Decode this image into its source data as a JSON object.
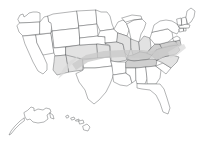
{
  "figure": {
    "type": "map",
    "projection": "albers-usa",
    "background_color": "#ffffff",
    "border_color": "#58595b",
    "highlight_color": "#cfcfcf",
    "partial_color": "#e2e2e2",
    "caption": ""
  },
  "map_data": {
    "title": "",
    "description": "Outline map of the United States with state boundaries. A diagonal gray shaded band sweeps from the desert Southwest northeast across the Plains and then east-southeast through the Ohio Valley and Upper South to the Mid-Atlantic coast.",
    "insets": [
      {
        "name": "Alaska",
        "abbr": "AK",
        "position": "lower-left"
      },
      {
        "name": "Hawaii",
        "abbr": "HI",
        "position": "lower-left-center"
      }
    ],
    "shaded_band": {
      "label": "",
      "color": "#c9c9c9",
      "opacity": 0.78,
      "direction": "southwest-to-northeast-then-east",
      "start_region": "Arizona / New Mexico",
      "end_region": "Virginia / Maryland / Delaware",
      "states_crossed": [
        "Arizona",
        "New Mexico",
        "Colorado",
        "Kansas",
        "Missouri",
        "Kentucky",
        "Tennessee",
        "West Virginia",
        "Virginia",
        "Maryland",
        "Delaware",
        "North Carolina"
      ]
    },
    "states": [
      {
        "abbr": "WA",
        "name": "Washington",
        "shaded": "none"
      },
      {
        "abbr": "OR",
        "name": "Oregon",
        "shaded": "none"
      },
      {
        "abbr": "CA",
        "name": "California",
        "shaded": "none"
      },
      {
        "abbr": "NV",
        "name": "Nevada",
        "shaded": "none"
      },
      {
        "abbr": "ID",
        "name": "Idaho",
        "shaded": "none"
      },
      {
        "abbr": "MT",
        "name": "Montana",
        "shaded": "none"
      },
      {
        "abbr": "WY",
        "name": "Wyoming",
        "shaded": "none"
      },
      {
        "abbr": "UT",
        "name": "Utah",
        "shaded": "none"
      },
      {
        "abbr": "AZ",
        "name": "Arizona",
        "shaded": "partial"
      },
      {
        "abbr": "NM",
        "name": "New Mexico",
        "shaded": "partial"
      },
      {
        "abbr": "CO",
        "name": "Colorado",
        "shaded": "partial"
      },
      {
        "abbr": "ND",
        "name": "North Dakota",
        "shaded": "none"
      },
      {
        "abbr": "SD",
        "name": "South Dakota",
        "shaded": "none"
      },
      {
        "abbr": "NE",
        "name": "Nebraska",
        "shaded": "none"
      },
      {
        "abbr": "KS",
        "name": "Kansas",
        "shaded": "partial"
      },
      {
        "abbr": "OK",
        "name": "Oklahoma",
        "shaded": "none"
      },
      {
        "abbr": "TX",
        "name": "Texas",
        "shaded": "none"
      },
      {
        "abbr": "MN",
        "name": "Minnesota",
        "shaded": "none"
      },
      {
        "abbr": "IA",
        "name": "Iowa",
        "shaded": "none"
      },
      {
        "abbr": "MO",
        "name": "Missouri",
        "shaded": "partial"
      },
      {
        "abbr": "AR",
        "name": "Arkansas",
        "shaded": "none"
      },
      {
        "abbr": "LA",
        "name": "Louisiana",
        "shaded": "none"
      },
      {
        "abbr": "WI",
        "name": "Wisconsin",
        "shaded": "none"
      },
      {
        "abbr": "IL",
        "name": "Illinois",
        "shaded": "partial"
      },
      {
        "abbr": "MI",
        "name": "Michigan",
        "shaded": "none"
      },
      {
        "abbr": "IN",
        "name": "Indiana",
        "shaded": "partial"
      },
      {
        "abbr": "OH",
        "name": "Ohio",
        "shaded": "partial"
      },
      {
        "abbr": "KY",
        "name": "Kentucky",
        "shaded": "full"
      },
      {
        "abbr": "TN",
        "name": "Tennessee",
        "shaded": "full"
      },
      {
        "abbr": "MS",
        "name": "Mississippi",
        "shaded": "none"
      },
      {
        "abbr": "AL",
        "name": "Alabama",
        "shaded": "none"
      },
      {
        "abbr": "GA",
        "name": "Georgia",
        "shaded": "none"
      },
      {
        "abbr": "FL",
        "name": "Florida",
        "shaded": "none"
      },
      {
        "abbr": "SC",
        "name": "South Carolina",
        "shaded": "none"
      },
      {
        "abbr": "NC",
        "name": "North Carolina",
        "shaded": "partial"
      },
      {
        "abbr": "VA",
        "name": "Virginia",
        "shaded": "full"
      },
      {
        "abbr": "WV",
        "name": "West Virginia",
        "shaded": "full"
      },
      {
        "abbr": "MD",
        "name": "Maryland",
        "shaded": "full"
      },
      {
        "abbr": "DE",
        "name": "Delaware",
        "shaded": "full"
      },
      {
        "abbr": "PA",
        "name": "Pennsylvania",
        "shaded": "none"
      },
      {
        "abbr": "NJ",
        "name": "New Jersey",
        "shaded": "none"
      },
      {
        "abbr": "NY",
        "name": "New York",
        "shaded": "none"
      },
      {
        "abbr": "CT",
        "name": "Connecticut",
        "shaded": "none"
      },
      {
        "abbr": "RI",
        "name": "Rhode Island",
        "shaded": "none"
      },
      {
        "abbr": "MA",
        "name": "Massachusetts",
        "shaded": "none"
      },
      {
        "abbr": "VT",
        "name": "Vermont",
        "shaded": "none"
      },
      {
        "abbr": "NH",
        "name": "New Hampshire",
        "shaded": "none"
      },
      {
        "abbr": "ME",
        "name": "Maine",
        "shaded": "none"
      },
      {
        "abbr": "AK",
        "name": "Alaska",
        "shaded": "none"
      },
      {
        "abbr": "HI",
        "name": "Hawaii",
        "shaded": "none"
      }
    ]
  }
}
